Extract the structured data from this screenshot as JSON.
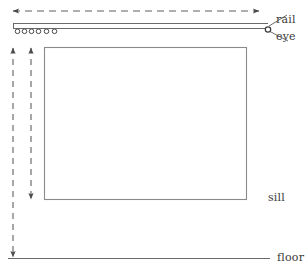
{
  "figure": {
    "title": "",
    "type": "technical-line-diagram",
    "width": 308,
    "height": 279,
    "background_color": "#ffffff",
    "line_color": "#555555",
    "dash_color": "#6b6b6b",
    "text_color": "#3a3a3a"
  },
  "labels": {
    "rail": "rail",
    "eye": "eye",
    "sill": "sill",
    "floor": "floor"
  },
  "elements": {
    "top_dimension_arrow": {
      "name": "horizontal-dashed-double-arrow",
      "orientation": "horizontal",
      "x1": 13,
      "y1": 11,
      "x2": 259,
      "y2": 11,
      "arrowheads": "both",
      "style": "dashed"
    },
    "rail": {
      "name": "rail-double-line",
      "x1": 13,
      "x2": 268,
      "y_top": 23,
      "y_bottom": 29,
      "style": "solid"
    },
    "rail_wheels": {
      "name": "rail-carrier-circles",
      "count": 6,
      "cx": [
        17,
        24,
        31,
        38,
        46,
        54
      ],
      "cy": 31,
      "r": 2.3
    },
    "eye": {
      "name": "eye-circle",
      "cx": 268,
      "cy": 29,
      "r": 2.6
    },
    "sill_rectangle": {
      "name": "window-sill-rectangle",
      "x": 44,
      "y": 47,
      "width": 203,
      "height": 153
    },
    "left_dimension_arrow_outer": {
      "name": "vertical-dashed-double-arrow-outer",
      "orientation": "vertical",
      "x": 13,
      "y1": 47,
      "y2": 258,
      "arrowheads": "both",
      "style": "dashed"
    },
    "left_dimension_arrow_inner": {
      "name": "vertical-dashed-double-arrow-inner",
      "orientation": "vertical",
      "x": 31,
      "y1": 47,
      "y2": 200,
      "arrowheads": "both",
      "style": "dashed"
    },
    "floor_line": {
      "name": "floor-line",
      "x1": 8,
      "y1": 258,
      "x2": 270,
      "y2": 258,
      "style": "solid"
    },
    "leader_rail": {
      "name": "rail-leader-line",
      "x1": 270,
      "y1": 26,
      "x2": 288,
      "y2": 14
    },
    "leader_eye": {
      "name": "eye-leader-line",
      "x1": 271,
      "y1": 31,
      "x2": 289,
      "y2": 40
    }
  }
}
